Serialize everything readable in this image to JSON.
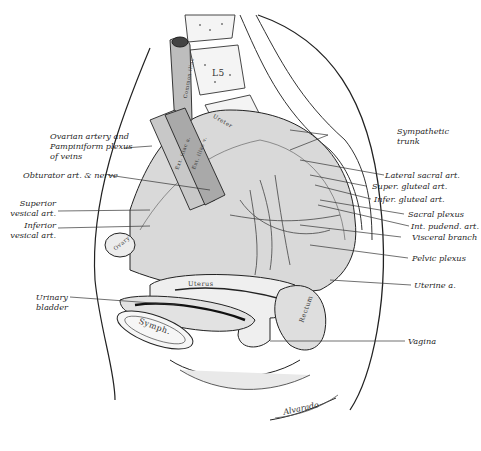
{
  "figure": {
    "type": "anatomical illustration",
    "signature": "Alvarado"
  },
  "labels_left": [
    {
      "id": "ovarian",
      "lines": [
        "Ovarian artery and",
        "Pampiniform plexus",
        "of veins"
      ]
    },
    {
      "id": "obturator",
      "lines": [
        "Obturator art. & nerve"
      ]
    },
    {
      "id": "sup-vesical",
      "lines": [
        "Superior",
        "vesical art."
      ]
    },
    {
      "id": "inf-vesical",
      "lines": [
        "Inferior",
        "vesical art."
      ]
    },
    {
      "id": "bladder",
      "lines": [
        "Urinary",
        "bladder"
      ]
    }
  ],
  "labels_right": [
    {
      "id": "sympathetic",
      "lines": [
        "Sympathetic",
        "trunk"
      ]
    },
    {
      "id": "lat-sacral",
      "lines": [
        "Lateral sacral art."
      ]
    },
    {
      "id": "sup-gluteal",
      "lines": [
        "Super. gluteal art."
      ]
    },
    {
      "id": "inf-gluteal",
      "lines": [
        "Infer. gluteal art."
      ]
    },
    {
      "id": "sacral-plexus",
      "lines": [
        "Sacral plexus"
      ]
    },
    {
      "id": "int-pudend",
      "lines": [
        "Int. pudend. art."
      ]
    },
    {
      "id": "visceral",
      "lines": [
        "Visceral branch"
      ]
    },
    {
      "id": "pelvic-plexus",
      "lines": [
        "Pelvic plexus"
      ]
    },
    {
      "id": "uterine",
      "lines": [
        "Uterine a."
      ]
    },
    {
      "id": "vagina",
      "lines": [
        "Vagina"
      ]
    }
  ],
  "inner_labels": {
    "vertebra": "L5",
    "uterus": "Uterus",
    "symphysis": "Symph.",
    "rectum": "Rectum",
    "ovary": "Ovary",
    "ureter": "Ureter",
    "common_iliac": "Common iliac",
    "ext_iliac_a": "Ext. iliac a.",
    "ext_iliac_v": "Ext. iliac v."
  }
}
